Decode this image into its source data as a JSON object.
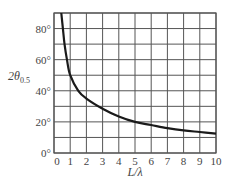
{
  "chart_data": {
    "type": "line",
    "title": "",
    "xlabel": "L/λ",
    "ylabel": "2θ0.5",
    "ylabel_main": "2θ",
    "ylabel_sub": "0.5",
    "xlim": [
      0,
      10
    ],
    "ylim": [
      0,
      90
    ],
    "grid": true,
    "x_ticks": [
      0,
      1,
      2,
      3,
      4,
      5,
      6,
      7,
      8,
      9,
      10
    ],
    "x_tick_labels": [
      "0",
      "1",
      "2",
      "3",
      "4",
      "5",
      "6",
      "7",
      "8",
      "9",
      "10"
    ],
    "y_ticks": [
      0,
      20,
      40,
      60,
      80
    ],
    "y_tick_labels": [
      "0°",
      "20°",
      "40°",
      "60°",
      "80°"
    ],
    "y_grid_step": 10,
    "series": [
      {
        "name": "2θ0.5 vs L/λ",
        "x": [
          0.45,
          0.55,
          0.65,
          0.8,
          1,
          1.5,
          2,
          3,
          4,
          5,
          6,
          7,
          8,
          9,
          10
        ],
        "values": [
          90,
          80,
          70,
          60,
          50,
          40,
          35,
          28.5,
          23.5,
          20,
          18,
          16,
          14.5,
          13.5,
          12.5
        ]
      }
    ],
    "colors": {
      "curve": "#1a1a1a",
      "grid": "#555555",
      "text": "#444444"
    }
  }
}
